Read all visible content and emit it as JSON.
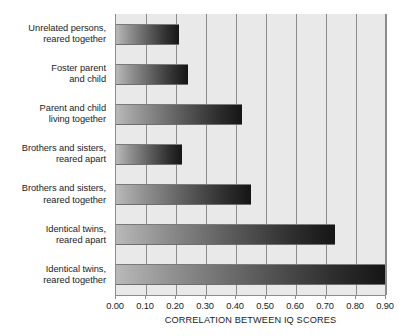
{
  "chart_data": {
    "type": "bar",
    "orientation": "horizontal",
    "title": "",
    "xlabel": "CORRELATION BETWEEN IQ SCORES",
    "ylabel": "",
    "xlim": [
      0.0,
      0.9
    ],
    "grid": true,
    "legend": "none",
    "xticks": [
      "0.00",
      "0.10",
      "0.20",
      "0.30",
      "0.40",
      "0.50",
      "0.60",
      "0.70",
      "0.80",
      "0.90"
    ],
    "xtick_values": [
      0.0,
      0.1,
      0.2,
      0.3,
      0.4,
      0.5,
      0.6,
      0.7,
      0.8,
      0.9
    ],
    "categories": [
      "Unrelated persons, reared together",
      "Foster parent and child",
      "Parent and child living together",
      "Brothers and sisters, reared apart",
      "Brothers and sisters, reared together",
      "Identical twins, reared apart",
      "Identical twins, reared together"
    ],
    "category_lines": [
      [
        "Unrelated persons,",
        "reared together"
      ],
      [
        "Foster parent",
        "and child"
      ],
      [
        "Parent and child",
        "living together"
      ],
      [
        "Brothers and sisters,",
        "reared apart"
      ],
      [
        "Brothers and sisters,",
        "reared together"
      ],
      [
        "Identical twins,",
        "reared apart"
      ],
      [
        "Identical twins,",
        "reared together"
      ]
    ],
    "values": [
      0.21,
      0.24,
      0.42,
      0.22,
      0.45,
      0.73,
      0.9
    ],
    "colors": {
      "plot_background": "#e9e9e9",
      "gridline": "#8c8c8c",
      "bar_gradient_start": "#b9b9b9",
      "bar_gradient_end": "#151515",
      "text": "#1c1c1c",
      "page_background": "#ffffff"
    }
  }
}
